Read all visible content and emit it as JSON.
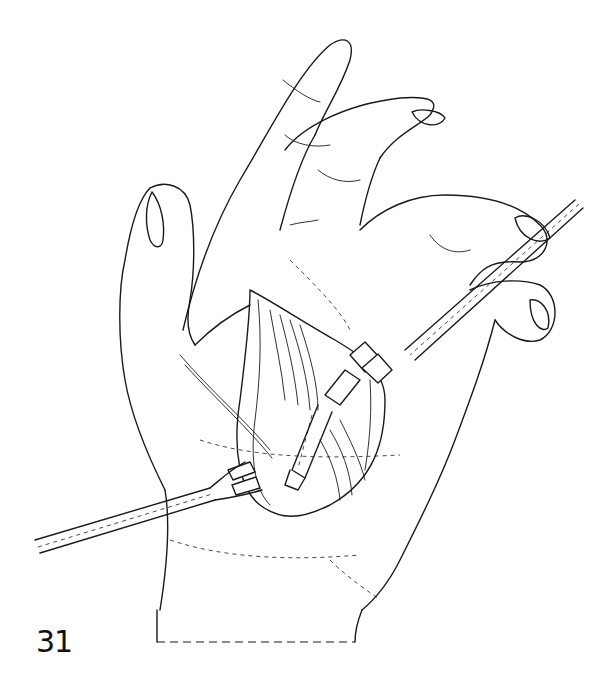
{
  "figure": {
    "number": "31",
    "colors": {
      "line": "#1a1a1a",
      "background": "#ffffff"
    },
    "elements": [
      "hand-palm",
      "thumb",
      "index-finger",
      "middle-finger",
      "ring-finger",
      "little-finger",
      "incision-opening",
      "retractor-upper",
      "retractor-lower",
      "tendon-graft",
      "wrist-cutoff-dashed-line"
    ]
  }
}
